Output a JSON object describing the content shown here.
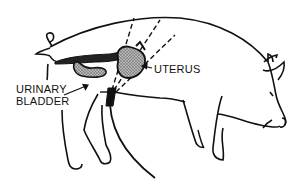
{
  "diagram": {
    "labels": {
      "uterus": "UTERUS",
      "urinary_bladder_line1": "URINARY",
      "urinary_bladder_line2": "BLADDER"
    },
    "colors": {
      "line": "#111111",
      "organ_fill": "#8a8a8a",
      "background": "#ffffff"
    }
  }
}
